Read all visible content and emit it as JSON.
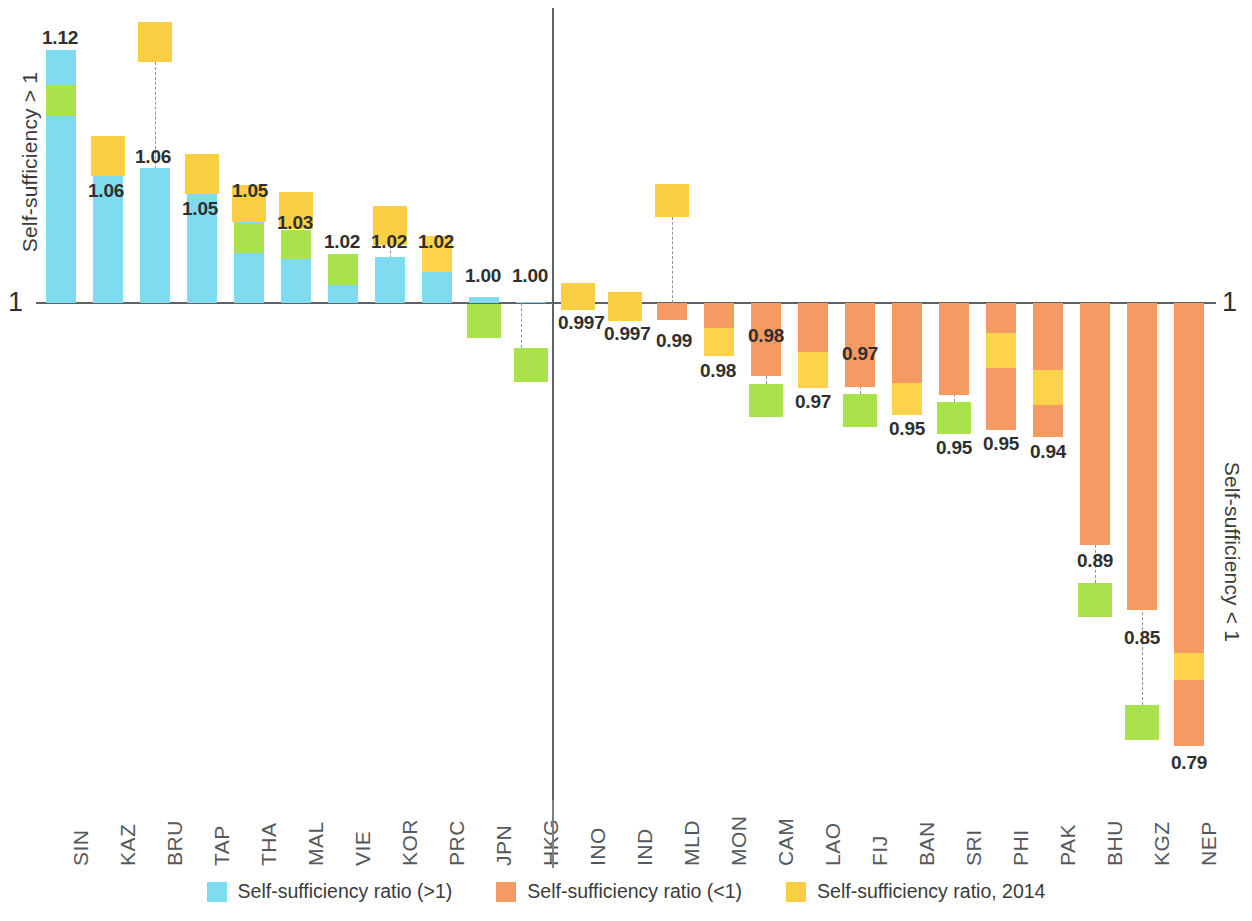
{
  "chart_data": {
    "type": "bar",
    "title": "",
    "subtitle": "",
    "xlabel": "",
    "ylabel_left": "Self-sufficiency > 1",
    "ylabel_right": "Self-sufficiency < 1",
    "baseline_label": "1",
    "baseline_value": 1,
    "grid": false,
    "legend_position": "bottom",
    "colors": {
      "above_one": "#7fdcf0",
      "below_one": "#f59a62",
      "marker_2014": "#fbcf44",
      "marker_current": "#a9e24b",
      "axis": "#5d6266",
      "text": "#3b3b3b"
    },
    "legend": [
      {
        "label": "Self-sufficiency ratio (>1)",
        "color": "#7fdcf0",
        "key": "above_one"
      },
      {
        "label": "Self-sufficiency ratio (<1)",
        "color": "#f59a62",
        "key": "below_one"
      },
      {
        "label": "Self-sufficiency ratio, 2014",
        "color": "#fbcf44",
        "key": "year_2014"
      }
    ],
    "groups": [
      {
        "name": "above_one",
        "label": "Self-sufficiency > 1"
      },
      {
        "name": "below_one",
        "label": "Self-sufficiency < 1"
      }
    ],
    "categories": [
      "SIN",
      "KAZ",
      "BRU",
      "TAP",
      "THA",
      "MAL",
      "VIE",
      "KOR",
      "PRC",
      "JPN",
      "HKG",
      "INO",
      "IND",
      "MLD",
      "MON",
      "CAM",
      "LAO",
      "FIJ",
      "BAN",
      "SRI",
      "PHI",
      "PAK",
      "BHU",
      "KGZ",
      "NEP"
    ],
    "values": [
      1.12,
      1.06,
      1.06,
      1.05,
      1.05,
      1.03,
      1.02,
      1.02,
      1.02,
      1.0,
      1.0,
      0.997,
      0.997,
      0.99,
      0.98,
      0.98,
      0.97,
      0.97,
      0.95,
      0.95,
      0.95,
      0.94,
      0.89,
      0.85,
      0.79
    ],
    "value_labels": [
      "1.12",
      "1.06",
      "1.06",
      "1.05",
      "1.05",
      "1.03",
      "1.02",
      "1.02",
      "1.02",
      "1.00",
      "1.00",
      "0.997",
      "0.997",
      "0.99",
      "0.98",
      "0.98",
      "0.97",
      "0.97",
      "0.95",
      "0.95",
      "0.95",
      "0.94",
      "0.89",
      "0.85",
      "0.79"
    ],
    "bars": [
      {
        "cat": "SIN",
        "value": 1.12,
        "label": "1.12",
        "side": "above",
        "bar_top": 50,
        "bar_bottom": 303,
        "green": {
          "top": 85,
          "bottom": 116
        },
        "yellow": null,
        "marker_green": null,
        "marker_yellow": null,
        "leader": {
          "x": 61,
          "top": 116,
          "bottom": 303
        },
        "label_x": 42,
        "label_y": 27
      },
      {
        "cat": "KAZ",
        "value": 1.06,
        "label": "1.06",
        "side": "above",
        "bar_top": 176,
        "bar_bottom": 303,
        "green": null,
        "yellow": null,
        "marker_green": null,
        "marker_yellow": {
          "top": 136,
          "bottom": 176
        },
        "leader": {
          "x": 108,
          "top": 136,
          "bottom": 303
        },
        "label_x": 88,
        "label_y": 180
      },
      {
        "cat": "BRU",
        "value": 1.06,
        "label": "1.06",
        "side": "above",
        "bar_top": 168,
        "bar_bottom": 303,
        "green": null,
        "yellow": null,
        "marker_green": null,
        "marker_yellow": {
          "top": 22,
          "bottom": 62
        },
        "leader": {
          "x": 155,
          "top": 62,
          "bottom": 303
        },
        "label_x": 135,
        "label_y": 146
      },
      {
        "cat": "TAP",
        "value": 1.05,
        "label": "1.05",
        "side": "above",
        "bar_top": 194,
        "bar_bottom": 303,
        "green": null,
        "yellow": null,
        "marker_green": null,
        "marker_yellow": {
          "top": 154,
          "bottom": 194
        },
        "leader": {
          "x": 202,
          "top": 154,
          "bottom": 303
        },
        "label_x": 182,
        "label_y": 198
      },
      {
        "cat": "THA",
        "value": 1.05,
        "label": "1.05",
        "side": "above",
        "bar_top": 203,
        "bar_bottom": 303,
        "green": {
          "top": 223,
          "bottom": 253
        },
        "yellow": null,
        "marker_green": null,
        "marker_yellow": {
          "top": 185,
          "bottom": 222
        },
        "leader": {
          "x": 249,
          "top": 253,
          "bottom": 303
        },
        "label_x": 232,
        "label_y": 180
      },
      {
        "cat": "MAL",
        "value": 1.03,
        "label": "1.03",
        "side": "above",
        "bar_top": 230,
        "bar_bottom": 303,
        "green": {
          "top": 230,
          "bottom": 259
        },
        "yellow": null,
        "marker_green": null,
        "marker_yellow": {
          "top": 192,
          "bottom": 229
        },
        "leader": {
          "x": 296,
          "top": 259,
          "bottom": 303
        },
        "label_x": 277,
        "label_y": 212
      },
      {
        "cat": "VIE",
        "value": 1.02,
        "label": "1.02",
        "side": "above",
        "bar_top": 272,
        "bar_bottom": 303,
        "green": {
          "top": 254,
          "bottom": 285
        },
        "yellow": null,
        "marker_green": null,
        "marker_yellow": null,
        "leader": {
          "x": 343,
          "top": 285,
          "bottom": 303
        },
        "label_x": 324,
        "label_y": 231
      },
      {
        "cat": "KOR",
        "value": 1.02,
        "label": "1.02",
        "side": "above",
        "bar_top": 257,
        "bar_bottom": 303,
        "green": null,
        "yellow": null,
        "marker_green": null,
        "marker_yellow": {
          "top": 206,
          "bottom": 245
        },
        "leader": {
          "x": 390,
          "top": 206,
          "bottom": 303
        },
        "label_x": 371,
        "label_y": 231
      },
      {
        "cat": "PRC",
        "value": 1.02,
        "label": "1.02",
        "side": "above",
        "bar_top": 272,
        "bar_bottom": 303,
        "green": null,
        "yellow": {
          "top": 236,
          "bottom": 272
        },
        "marker_green": null,
        "marker_yellow": null,
        "leader": {
          "x": 437,
          "top": 272,
          "bottom": 303
        },
        "label_x": 418,
        "label_y": 231
      },
      {
        "cat": "JPN",
        "value": 1.0,
        "label": "1.00",
        "side": "above",
        "bar_top": 297,
        "bar_bottom": 303,
        "green": null,
        "yellow": null,
        "marker_green": {
          "top": 304,
          "bottom": 338
        },
        "marker_yellow": null,
        "leader": null,
        "label_x": 465,
        "label_y": 265
      },
      {
        "cat": "HKG",
        "value": 1.0,
        "label": "1.00",
        "side": "above",
        "bar_top": 302,
        "bar_bottom": 303,
        "green": null,
        "yellow": null,
        "marker_green": {
          "top": 348,
          "bottom": 382
        },
        "marker_yellow": null,
        "leader": {
          "x": 521,
          "top": 303,
          "bottom": 348
        },
        "label_x": 512,
        "label_y": 265
      },
      {
        "cat": "INO",
        "value": 0.997,
        "label": "0.997",
        "side": "below",
        "bar_top": 303,
        "bar_bottom": 306,
        "green": null,
        "yellow": null,
        "marker_green": null,
        "marker_yellow": {
          "top": 283,
          "bottom": 310
        },
        "leader": null,
        "label_x": 558,
        "label_y": 312
      },
      {
        "cat": "IND",
        "value": 0.997,
        "label": "0.997",
        "side": "below",
        "bar_top": 303,
        "bar_bottom": 306,
        "green": null,
        "yellow": null,
        "marker_green": null,
        "marker_yellow": {
          "top": 292,
          "bottom": 321
        },
        "leader": null,
        "label_x": 604,
        "label_y": 323
      },
      {
        "cat": "MLD",
        "value": 0.99,
        "label": "0.99",
        "side": "below",
        "bar_top": 303,
        "bar_bottom": 320,
        "green": null,
        "yellow": null,
        "marker_green": null,
        "marker_yellow": {
          "top": 184,
          "bottom": 217
        },
        "leader": {
          "x": 672,
          "top": 217,
          "bottom": 303
        },
        "label_x": 656,
        "label_y": 330
      },
      {
        "cat": "MON",
        "value": 0.98,
        "label": "0.98",
        "side": "below",
        "bar_top": 303,
        "bar_bottom": 356,
        "green": null,
        "yellow": {
          "top": 328,
          "bottom": 356
        },
        "marker_green": null,
        "marker_yellow": null,
        "leader": {
          "x": 719,
          "top": 303,
          "bottom": 328
        },
        "label_x": 700,
        "label_y": 360
      },
      {
        "cat": "CAM",
        "value": 0.98,
        "label": "0.98",
        "side": "below",
        "bar_top": 303,
        "bar_bottom": 376,
        "green": null,
        "yellow": null,
        "marker_green": {
          "top": 384,
          "bottom": 417
        },
        "marker_yellow": null,
        "leader": {
          "x": 766,
          "top": 303,
          "bottom": 384
        },
        "label_x": 748,
        "label_y": 325
      },
      {
        "cat": "LAO",
        "value": 0.97,
        "label": "0.97",
        "side": "below",
        "bar_top": 303,
        "bar_bottom": 388,
        "green": null,
        "yellow": {
          "top": 352,
          "bottom": 388
        },
        "marker_green": null,
        "marker_yellow": null,
        "leader": {
          "x": 813,
          "top": 303,
          "bottom": 352
        },
        "label_x": 795,
        "label_y": 391
      },
      {
        "cat": "FIJ",
        "value": 0.97,
        "label": "0.97",
        "side": "below",
        "bar_top": 303,
        "bar_bottom": 387,
        "green": null,
        "yellow": null,
        "marker_green": {
          "top": 394,
          "bottom": 427
        },
        "marker_yellow": null,
        "leader": {
          "x": 860,
          "top": 303,
          "bottom": 394
        },
        "label_x": 842,
        "label_y": 343
      },
      {
        "cat": "BAN",
        "value": 0.95,
        "label": "0.95",
        "side": "below",
        "bar_top": 303,
        "bar_bottom": 415,
        "green": null,
        "yellow": {
          "top": 383,
          "bottom": 415
        },
        "marker_green": null,
        "marker_yellow": null,
        "leader": {
          "x": 907,
          "top": 303,
          "bottom": 383
        },
        "label_x": 889,
        "label_y": 418
      },
      {
        "cat": "SRI",
        "value": 0.95,
        "label": "0.95",
        "side": "below",
        "bar_top": 303,
        "bar_bottom": 395,
        "green": null,
        "yellow": null,
        "marker_green": {
          "top": 402,
          "bottom": 434
        },
        "marker_yellow": null,
        "leader": {
          "x": 954,
          "top": 303,
          "bottom": 402
        },
        "label_x": 936,
        "label_y": 437
      },
      {
        "cat": "PHI",
        "value": 0.95,
        "label": "0.95",
        "side": "below",
        "bar_top": 303,
        "bar_bottom": 430,
        "green": null,
        "yellow": {
          "top": 333,
          "bottom": 368
        },
        "marker_green": null,
        "marker_yellow": null,
        "leader": {
          "x": 1001,
          "top": 303,
          "bottom": 430
        },
        "label_x": 983,
        "label_y": 433
      },
      {
        "cat": "PAK",
        "value": 0.94,
        "label": "0.94",
        "side": "below",
        "bar_top": 303,
        "bar_bottom": 437,
        "green": null,
        "yellow": {
          "top": 370,
          "bottom": 405
        },
        "marker_green": null,
        "marker_yellow": null,
        "leader": {
          "x": 1048,
          "top": 303,
          "bottom": 437
        },
        "label_x": 1030,
        "label_y": 441
      },
      {
        "cat": "BHU",
        "value": 0.89,
        "label": "0.89",
        "side": "below",
        "bar_top": 303,
        "bar_bottom": 545,
        "green": null,
        "yellow": null,
        "marker_green": {
          "top": 583,
          "bottom": 617
        },
        "marker_yellow": null,
        "leader": {
          "x": 1095,
          "top": 303,
          "bottom": 583
        },
        "label_x": 1077,
        "label_y": 550
      },
      {
        "cat": "KGZ",
        "value": 0.85,
        "label": "0.85",
        "side": "below",
        "bar_top": 303,
        "bar_bottom": 610,
        "green": null,
        "yellow": null,
        "marker_green": {
          "top": 705,
          "bottom": 740
        },
        "marker_yellow": null,
        "leader": {
          "x": 1142,
          "top": 303,
          "bottom": 705
        },
        "label_x": 1124,
        "label_y": 627
      },
      {
        "cat": "NEP",
        "value": 0.79,
        "label": "0.79",
        "side": "below",
        "bar_top": 303,
        "bar_bottom": 746,
        "green": null,
        "yellow": {
          "top": 653,
          "bottom": 680
        },
        "marker_green": null,
        "marker_yellow": null,
        "leader": {
          "x": 1189,
          "top": 303,
          "bottom": 653
        },
        "label_x": 1171,
        "label_y": 752
      }
    ]
  }
}
